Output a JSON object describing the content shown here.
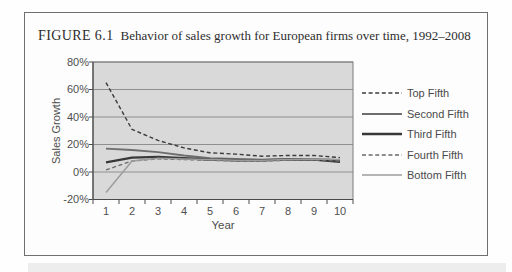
{
  "figure": {
    "label": "FIGURE 6.1",
    "caption": "Behavior of sales growth for European firms over time, 1992–2008"
  },
  "chart_data": {
    "type": "line",
    "title": "",
    "xlabel": "Year",
    "ylabel": "Sales Growth",
    "x": [
      "1",
      "2",
      "3",
      "4",
      "5",
      "6",
      "7",
      "8",
      "9",
      "10"
    ],
    "ylim": [
      -20,
      80
    ],
    "ytick_values": [
      80,
      60,
      40,
      20,
      0,
      -20
    ],
    "ytick_labels": [
      "80%",
      "60%",
      "40%",
      "20%",
      "0%",
      "-20%"
    ],
    "grid": "horizontal",
    "legend_position": "right",
    "colors": {
      "plot_background": "#d9d9d9",
      "gridline": "#8f8f8f",
      "axis": "#4a4a4a",
      "plot_border": "#7d7d7d",
      "text": "#4d4d4d",
      "figure_border": "#6f6f6f"
    },
    "series": [
      {
        "name": "Top Fifth",
        "line_style": "dashed",
        "color": "#3c3c3c",
        "width": 1.4,
        "values": [
          65,
          31,
          23,
          17.5,
          14,
          13,
          11.5,
          12,
          12,
          10.5
        ]
      },
      {
        "name": "Second Fifth",
        "line_style": "solid",
        "color": "#6e6e6e",
        "width": 1.9,
        "values": [
          17,
          16,
          14.5,
          12,
          10,
          9.5,
          9,
          9.5,
          9.5,
          8.5
        ]
      },
      {
        "name": "Third Fifth",
        "line_style": "solid",
        "color": "#383838",
        "width": 2.4,
        "values": [
          7,
          10.5,
          11,
          10,
          9,
          8.5,
          8.5,
          9,
          9,
          7.5
        ]
      },
      {
        "name": "Fourth Fifth",
        "line_style": "dashed",
        "color": "#6a6a6a",
        "width": 1.3,
        "values": [
          1.5,
          8,
          9.5,
          9,
          8.5,
          8,
          8,
          8.5,
          8.5,
          8
        ]
      },
      {
        "name": "Bottom Fifth",
        "line_style": "solid",
        "color": "#9c9c9c",
        "width": 1.5,
        "values": [
          -15,
          8,
          10,
          9.5,
          9,
          8.5,
          8.5,
          9,
          9.5,
          9
        ]
      }
    ]
  }
}
